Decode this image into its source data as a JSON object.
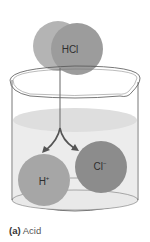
{
  "diagram": {
    "molecule": {
      "label": "HCl"
    },
    "ions": [
      {
        "symbol": "H",
        "charge": "+",
        "label": "H+"
      },
      {
        "symbol": "Cl",
        "charge": "−",
        "label": "Cl−"
      }
    ],
    "colors": {
      "hcl_h_sphere": "#b4b4b4",
      "hcl_cl_sphere": "#9a9a9a",
      "h_ion": "#a4a4a4",
      "cl_ion": "#8a8a8a",
      "liquid": "#e6e6e6",
      "glass_outline": "#555555"
    }
  },
  "caption": {
    "tag": "(a)",
    "text": "Acid"
  }
}
